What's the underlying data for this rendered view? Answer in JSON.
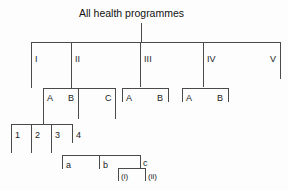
{
  "diagram": {
    "title": "All health programmes",
    "type": "organisational-hierarchy-tree",
    "line_color": "#4a4a4a",
    "background": "#fdfdfd",
    "levels": [
      {
        "level": 1,
        "name": "roman-numeral-level",
        "items": [
          {
            "label": "I"
          },
          {
            "label": "II"
          },
          {
            "label": "III"
          },
          {
            "label": "IV"
          },
          {
            "label": "V"
          }
        ]
      },
      {
        "level": 2,
        "name": "letter-level",
        "groups": [
          {
            "parent": "II",
            "items": [
              {
                "label": "A"
              },
              {
                "label": "B"
              },
              {
                "label": "C"
              }
            ]
          },
          {
            "parent": "III",
            "items": [
              {
                "label": "A"
              },
              {
                "label": "B"
              }
            ]
          },
          {
            "parent": "IV",
            "items": [
              {
                "label": "A"
              },
              {
                "label": "B"
              }
            ]
          }
        ]
      },
      {
        "level": 3,
        "name": "numeric-level",
        "groups": [
          {
            "parent": "II.A",
            "items": [
              {
                "label": "1"
              },
              {
                "label": "2"
              },
              {
                "label": "3"
              },
              {
                "label": "4"
              }
            ]
          }
        ]
      },
      {
        "level": 4,
        "name": "lowercase-letter-level",
        "groups": [
          {
            "parent": "II.A.3",
            "items": [
              {
                "label": "a"
              },
              {
                "label": "b"
              },
              {
                "label": "c"
              }
            ]
          }
        ]
      },
      {
        "level": 5,
        "name": "roman-lowercase-level",
        "groups": [
          {
            "parent": "II.A.3.c",
            "items": [
              {
                "label": "(i)"
              },
              {
                "label": "(ii)"
              }
            ]
          }
        ]
      }
    ]
  }
}
